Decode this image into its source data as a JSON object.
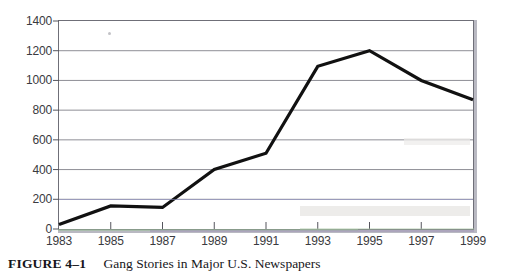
{
  "figure": {
    "caption_number": "FIGURE 4–1",
    "caption_title": "Gang Stories in Major U.S. Newspapers"
  },
  "chart_data": {
    "type": "line",
    "title": "Gang Stories in Major U.S. Newspapers",
    "xlabel": "",
    "ylabel": "",
    "x": [
      1983,
      1985,
      1987,
      1989,
      1991,
      1993,
      1995,
      1997,
      1999
    ],
    "values": [
      30,
      155,
      145,
      400,
      510,
      1095,
      1200,
      1000,
      870
    ],
    "series": [
      {
        "name": "Gang stories",
        "values": [
          30,
          155,
          145,
          400,
          510,
          1095,
          1200,
          1000,
          870
        ]
      }
    ],
    "xlim": [
      1983,
      1999
    ],
    "ylim": [
      0,
      1400
    ],
    "x_tick_labels": [
      "1983",
      "1985",
      "1987",
      "1989",
      "1991",
      "1993",
      "1995",
      "1997",
      "1999"
    ],
    "y_tick_labels": [
      "0",
      "200",
      "400",
      "600",
      "800",
      "1000",
      "1200",
      "1400"
    ],
    "y_ticks": [
      0,
      200,
      400,
      600,
      800,
      1000,
      1200,
      1400
    ],
    "grid": "horizontal",
    "legend": "none",
    "line_color": "#111111",
    "grid_color": "#8e8e96",
    "frame_color": "#6f6f78"
  }
}
